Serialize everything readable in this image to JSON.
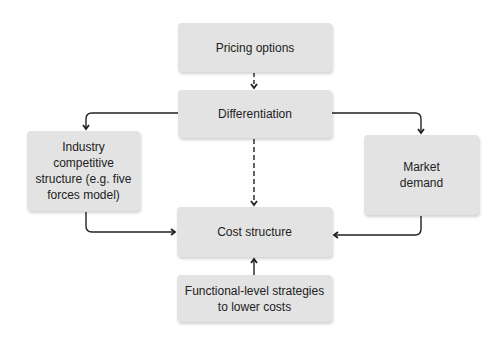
{
  "diagram": {
    "nodes": {
      "pricing": {
        "label": "Pricing options"
      },
      "differentiation": {
        "label": "Differentiation"
      },
      "industry": {
        "label": "Industry competitive structure (e.g. five forces model)"
      },
      "market": {
        "label": "Market demand"
      },
      "cost": {
        "label": "Cost structure"
      },
      "functional": {
        "label": "Functional-level strategies to lower costs"
      }
    },
    "edges": [
      {
        "from": "Pricing options",
        "to": "Differentiation",
        "style": "dashed"
      },
      {
        "from": "Differentiation",
        "to": "Industry competitive structure",
        "style": "solid"
      },
      {
        "from": "Differentiation",
        "to": "Market demand",
        "style": "solid"
      },
      {
        "from": "Differentiation",
        "to": "Cost structure",
        "style": "dashed"
      },
      {
        "from": "Industry competitive structure",
        "to": "Cost structure",
        "style": "solid"
      },
      {
        "from": "Market demand",
        "to": "Cost structure",
        "style": "solid"
      },
      {
        "from": "Functional-level strategies to lower costs",
        "to": "Cost structure",
        "style": "solid"
      }
    ],
    "colors": {
      "box": "#e3e3e3",
      "line": "#222222",
      "text": "#222222"
    }
  }
}
